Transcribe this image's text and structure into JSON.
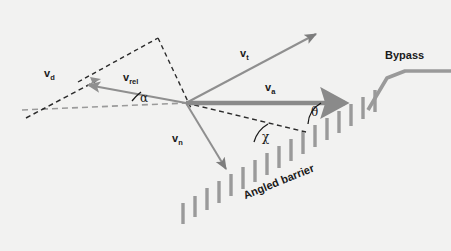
{
  "figure": {
    "background_color": "#f2f2f1",
    "vector_color": "#8f8f8f",
    "thick_vector_color": "#8a8a8a",
    "barrier_color": "#9a9a9a",
    "dashed_black_color": "#2b2b2b",
    "dashed_grey_color": "#9a9a9a",
    "text_color": "#1a1a1a"
  },
  "labels": {
    "v_d": {
      "base": "v",
      "sub": "d"
    },
    "v_rel": {
      "base": "v",
      "sub": "rel"
    },
    "v_t": {
      "base": "v",
      "sub": "t"
    },
    "v_a": {
      "base": "v",
      "sub": "a"
    },
    "v_n": {
      "base": "v",
      "sub": "n"
    },
    "alpha": "α",
    "chi": "χ",
    "theta": "θ",
    "angled_barrier": "Angled barrier",
    "bypass": "Bypass"
  },
  "diagram_data": {
    "type": "vector-diagram",
    "origin": {
      "x": 186,
      "y": 103
    },
    "vectors": [
      {
        "name": "v_d",
        "label": "v_d",
        "style": "dashed-black-with-arrow",
        "from": {
          "x": 28,
          "y": 117
        },
        "to": {
          "x": 92,
          "y": 84
        },
        "description": "drift velocity along black dashed line, up-right"
      },
      {
        "name": "v_rel",
        "label": "v_rel",
        "style": "solid-arrow",
        "from": {
          "x": 186,
          "y": 103
        },
        "to": {
          "x": 84,
          "y": 85
        },
        "description": "relative velocity pointing up-left from origin"
      },
      {
        "name": "v_t",
        "label": "v_t",
        "style": "solid-arrow",
        "from": {
          "x": 186,
          "y": 103
        },
        "to": {
          "x": 318,
          "y": 33
        },
        "description": "tangential velocity, up-right"
      },
      {
        "name": "v_a",
        "label": "v_a",
        "style": "thick-solid-arrow",
        "from": {
          "x": 186,
          "y": 103
        },
        "to": {
          "x": 352,
          "y": 103
        },
        "description": "horizontal approach velocity to the right"
      },
      {
        "name": "v_n",
        "label": "v_n",
        "style": "solid-arrow",
        "from": {
          "x": 186,
          "y": 103
        },
        "to": {
          "x": 228,
          "y": 172
        },
        "description": "normal velocity, down-right toward barrier"
      }
    ],
    "construction_lines": [
      {
        "name": "horizontal-reference",
        "style": "dashed-grey",
        "from": {
          "x": 22,
          "y": 110
        },
        "to": {
          "x": 186,
          "y": 103
        }
      },
      {
        "name": "dashed-triangle-left",
        "style": "dashed-black",
        "from": {
          "x": 78,
          "y": 82
        },
        "to": {
          "x": 158,
          "y": 38
        }
      },
      {
        "name": "dashed-triangle-right",
        "style": "dashed-black",
        "from": {
          "x": 158,
          "y": 38
        },
        "to": {
          "x": 190,
          "y": 107
        }
      },
      {
        "name": "barrier-normal-dashed",
        "style": "dashed-black",
        "from": {
          "x": 186,
          "y": 103
        },
        "to": {
          "x": 305,
          "y": 131
        }
      }
    ],
    "angles": [
      {
        "name": "alpha",
        "label": "α",
        "between": [
          "horizontal-reference",
          "v_rel"
        ],
        "vertex": {
          "x": 186,
          "y": 103
        },
        "label_pos": {
          "x": 124,
          "y": 98
        }
      },
      {
        "name": "chi",
        "label": "χ",
        "between": [
          "barrier-normal-dashed",
          "barrier"
        ],
        "vertex": {
          "x": 268,
          "y": 124
        },
        "label_pos": {
          "x": 262,
          "y": 143
        }
      },
      {
        "name": "theta",
        "label": "θ",
        "between": [
          "barrier",
          "v_a"
        ],
        "vertex": {
          "x": 318,
          "y": 103
        },
        "label_pos": {
          "x": 312,
          "y": 119
        }
      }
    ],
    "barrier": {
      "name": "angled-barrier",
      "label": "Angled barrier",
      "tick_count": 17,
      "direction": "rising to the right",
      "start": {
        "x": 182,
        "y": 222
      },
      "end": {
        "x": 378,
        "y": 92
      },
      "label_rotation_deg": -22
    },
    "bypass": {
      "name": "bypass",
      "label": "Bypass",
      "points": [
        {
          "x": 368,
          "y": 108
        },
        {
          "x": 386,
          "y": 78
        },
        {
          "x": 404,
          "y": 71
        },
        {
          "x": 451,
          "y": 71
        }
      ]
    }
  }
}
